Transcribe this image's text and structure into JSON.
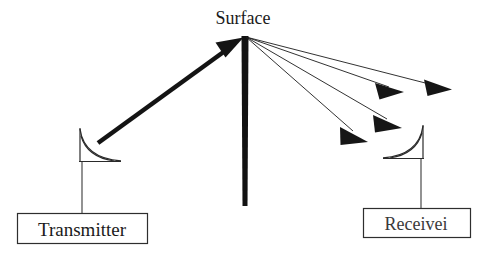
{
  "diagram": {
    "background_color": "#ffffff",
    "ink_color": "#111111",
    "faded_ink_color": "#4a4a4a",
    "labels": {
      "surface": "Surface",
      "transmitter": "Transmitter",
      "receiver": "Receivei"
    },
    "nodes": {
      "surface_bar": {
        "name": "Surface",
        "x": 244.5,
        "y_top": 36,
        "y_bottom": 206,
        "width": 7,
        "color": "#111111"
      },
      "scatter_origin": {
        "x": 246,
        "y": 37
      },
      "transmitter_antenna": {
        "label": "Transmitter",
        "x": 80,
        "y_top": 128,
        "y_base": 162,
        "mouth_x": 120,
        "orientation": "right-facing"
      },
      "receiver_antenna": {
        "label": "Receiver",
        "x": 423,
        "y_top": 125,
        "y_base": 159,
        "mouth_x": 384,
        "orientation": "left-facing"
      },
      "transmitter_box": {
        "x": 17,
        "y": 213,
        "width": 130,
        "height": 31,
        "label": "Transmitter"
      },
      "receiver_box": {
        "x": 363,
        "y": 208,
        "width": 107,
        "height": 30,
        "label": "Receivei"
      }
    },
    "incident_ray": {
      "name": "incident-beam",
      "from": {
        "x": 98,
        "y": 143
      },
      "to": {
        "x": 242,
        "y": 39
      },
      "stroke_width": 4.5,
      "arrow_size": 13,
      "color": "#111111"
    },
    "scattered_rays": [
      {
        "name": "scattered-ray-1",
        "from": {
          "x": 246,
          "y": 37
        },
        "to": {
          "x": 449,
          "y": 89
        },
        "arrow_size": 10,
        "stroke_width": 0.9
      },
      {
        "name": "scattered-ray-2",
        "from": {
          "x": 246,
          "y": 37
        },
        "to": {
          "x": 401,
          "y": 91
        },
        "arrow_size": 10,
        "stroke_width": 0.9
      },
      {
        "name": "scattered-ray-3",
        "from": {
          "x": 246,
          "y": 37
        },
        "to": {
          "x": 400,
          "y": 125
        },
        "arrow_size": 10,
        "stroke_width": 0.9
      },
      {
        "name": "scattered-ray-4",
        "from": {
          "x": 246,
          "y": 37
        },
        "to": {
          "x": 366,
          "y": 139
        },
        "arrow_size": 10,
        "stroke_width": 0.9
      }
    ],
    "connectors": [
      {
        "name": "transmitter-connector",
        "from": {
          "x": 82,
          "y": 162
        },
        "to": {
          "x": 82,
          "y": 213
        }
      },
      {
        "name": "receiver-connector",
        "from": {
          "x": 421,
          "y": 159
        },
        "to": {
          "x": 421,
          "y": 208
        }
      }
    ],
    "label_positions": {
      "surface": {
        "x": 243,
        "y": 24
      },
      "transmitter": {
        "x": 82,
        "y": 236
      },
      "receiver": {
        "x": 416,
        "y": 230
      }
    }
  }
}
